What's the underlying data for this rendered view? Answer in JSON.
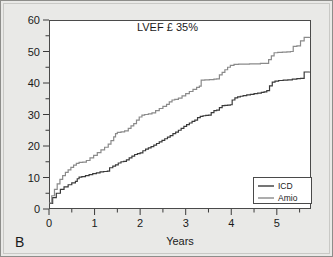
{
  "figure": {
    "panel_label": "B",
    "background_color": "#e9e9e7",
    "plot_background_color": "#ffffff",
    "border_color": "#8d8d8a"
  },
  "chart_data": {
    "type": "line",
    "subtype": "kaplan-meier-cumulative-event",
    "title": "LVEF £ 35%",
    "xlabel": "Years",
    "ylabel": "",
    "xlim": [
      0,
      5.75
    ],
    "ylim": [
      0,
      60
    ],
    "grid": false,
    "legend_position": "lower-right-inside",
    "x_ticks": [
      0,
      1,
      2,
      3,
      4,
      5
    ],
    "x_tick_labels": [
      "0",
      "1",
      "2",
      "3",
      "4",
      "5"
    ],
    "x_minor_ticks": [
      0.5,
      1.5,
      2.5,
      3.5,
      4.5,
      5.5
    ],
    "y_ticks": [
      0,
      10,
      20,
      30,
      40,
      50,
      60
    ],
    "y_tick_labels": [
      "0",
      "10",
      "20",
      "30",
      "40",
      "50",
      "60"
    ],
    "y_minor_ticks": [
      5,
      15,
      25,
      35,
      45,
      55
    ],
    "series": [
      {
        "name": "ICD",
        "color": "#3a3a3a",
        "linewidth": 1.2,
        "points": [
          [
            0.0,
            1.8
          ],
          [
            0.08,
            3.6
          ],
          [
            0.16,
            5.0
          ],
          [
            0.25,
            6.2
          ],
          [
            0.33,
            7.0
          ],
          [
            0.42,
            7.7
          ],
          [
            0.5,
            8.3
          ],
          [
            0.58,
            8.8
          ],
          [
            0.62,
            9.6
          ],
          [
            0.66,
            10.1
          ],
          [
            0.72,
            10.3
          ],
          [
            0.8,
            10.6
          ],
          [
            0.88,
            10.9
          ],
          [
            0.96,
            11.2
          ],
          [
            1.04,
            11.5
          ],
          [
            1.12,
            11.8
          ],
          [
            1.2,
            11.9
          ],
          [
            1.28,
            12.0
          ],
          [
            1.33,
            13.1
          ],
          [
            1.4,
            13.6
          ],
          [
            1.46,
            14.0
          ],
          [
            1.52,
            14.6
          ],
          [
            1.58,
            15.0
          ],
          [
            1.64,
            15.1
          ],
          [
            1.7,
            15.6
          ],
          [
            1.76,
            16.2
          ],
          [
            1.82,
            16.8
          ],
          [
            1.88,
            17.3
          ],
          [
            1.94,
            17.6
          ],
          [
            2.0,
            17.8
          ],
          [
            2.06,
            18.5
          ],
          [
            2.12,
            19.0
          ],
          [
            2.18,
            19.4
          ],
          [
            2.24,
            19.8
          ],
          [
            2.3,
            20.3
          ],
          [
            2.36,
            20.8
          ],
          [
            2.42,
            21.3
          ],
          [
            2.48,
            21.8
          ],
          [
            2.54,
            22.3
          ],
          [
            2.6,
            22.8
          ],
          [
            2.66,
            23.3
          ],
          [
            2.72,
            23.9
          ],
          [
            2.78,
            24.4
          ],
          [
            2.84,
            25.0
          ],
          [
            2.9,
            25.6
          ],
          [
            2.96,
            26.2
          ],
          [
            3.02,
            26.8
          ],
          [
            3.08,
            27.3
          ],
          [
            3.14,
            27.8
          ],
          [
            3.2,
            28.2
          ],
          [
            3.26,
            29.0
          ],
          [
            3.32,
            29.4
          ],
          [
            3.38,
            29.6
          ],
          [
            3.44,
            29.7
          ],
          [
            3.5,
            29.8
          ],
          [
            3.56,
            30.6
          ],
          [
            3.62,
            31.2
          ],
          [
            3.68,
            31.4
          ],
          [
            3.74,
            32.2
          ],
          [
            3.8,
            32.8
          ],
          [
            3.86,
            32.9
          ],
          [
            3.92,
            33.0
          ],
          [
            3.98,
            33.1
          ],
          [
            4.02,
            34.6
          ],
          [
            4.08,
            35.3
          ],
          [
            4.14,
            35.6
          ],
          [
            4.2,
            35.8
          ],
          [
            4.26,
            36.0
          ],
          [
            4.34,
            36.2
          ],
          [
            4.42,
            36.4
          ],
          [
            4.5,
            36.6
          ],
          [
            4.58,
            36.8
          ],
          [
            4.66,
            37.0
          ],
          [
            4.72,
            37.2
          ],
          [
            4.78,
            37.6
          ],
          [
            4.84,
            39.1
          ],
          [
            4.9,
            40.3
          ],
          [
            4.96,
            40.6
          ],
          [
            5.04,
            40.8
          ],
          [
            5.14,
            40.9
          ],
          [
            5.24,
            41.0
          ],
          [
            5.34,
            41.2
          ],
          [
            5.44,
            41.4
          ],
          [
            5.52,
            41.5
          ],
          [
            5.6,
            43.5
          ],
          [
            5.72,
            43.6
          ]
        ]
      },
      {
        "name": "Amio",
        "color": "#8a8a8a",
        "linewidth": 1.2,
        "points": [
          [
            0.0,
            1.9
          ],
          [
            0.06,
            4.2
          ],
          [
            0.12,
            6.2
          ],
          [
            0.18,
            8.0
          ],
          [
            0.24,
            9.4
          ],
          [
            0.3,
            10.6
          ],
          [
            0.36,
            11.6
          ],
          [
            0.42,
            12.4
          ],
          [
            0.48,
            13.2
          ],
          [
            0.54,
            13.9
          ],
          [
            0.6,
            14.5
          ],
          [
            0.66,
            14.8
          ],
          [
            0.74,
            14.9
          ],
          [
            0.82,
            15.4
          ],
          [
            0.9,
            16.2
          ],
          [
            0.98,
            17.0
          ],
          [
            1.06,
            17.9
          ],
          [
            1.14,
            18.8
          ],
          [
            1.22,
            19.6
          ],
          [
            1.3,
            20.6
          ],
          [
            1.36,
            21.7
          ],
          [
            1.42,
            22.9
          ],
          [
            1.46,
            23.9
          ],
          [
            1.5,
            24.3
          ],
          [
            1.58,
            24.5
          ],
          [
            1.66,
            24.8
          ],
          [
            1.74,
            25.6
          ],
          [
            1.8,
            26.4
          ],
          [
            1.86,
            27.1
          ],
          [
            1.92,
            28.2
          ],
          [
            1.98,
            29.2
          ],
          [
            2.04,
            29.8
          ],
          [
            2.1,
            30.0
          ],
          [
            2.18,
            30.2
          ],
          [
            2.26,
            30.5
          ],
          [
            2.34,
            31.2
          ],
          [
            2.42,
            31.9
          ],
          [
            2.5,
            32.6
          ],
          [
            2.58,
            33.2
          ],
          [
            2.64,
            34.0
          ],
          [
            2.7,
            34.6
          ],
          [
            2.76,
            34.8
          ],
          [
            2.84,
            35.2
          ],
          [
            2.92,
            35.9
          ],
          [
            3.0,
            36.6
          ],
          [
            3.08,
            37.3
          ],
          [
            3.16,
            38.0
          ],
          [
            3.24,
            38.6
          ],
          [
            3.3,
            39.0
          ],
          [
            3.34,
            40.9
          ],
          [
            3.42,
            41.0
          ],
          [
            3.52,
            41.1
          ],
          [
            3.62,
            41.2
          ],
          [
            3.68,
            41.3
          ],
          [
            3.74,
            42.6
          ],
          [
            3.8,
            43.4
          ],
          [
            3.86,
            44.2
          ],
          [
            3.92,
            45.0
          ],
          [
            3.98,
            45.6
          ],
          [
            4.06,
            45.9
          ],
          [
            4.16,
            46.0
          ],
          [
            4.28,
            46.0
          ],
          [
            4.4,
            46.1
          ],
          [
            4.52,
            46.1
          ],
          [
            4.64,
            46.2
          ],
          [
            4.76,
            46.2
          ],
          [
            4.82,
            47.4
          ],
          [
            4.88,
            48.6
          ],
          [
            4.94,
            49.6
          ],
          [
            5.02,
            49.7
          ],
          [
            5.12,
            49.8
          ],
          [
            5.22,
            49.9
          ],
          [
            5.3,
            50.0
          ],
          [
            5.36,
            51.6
          ],
          [
            5.44,
            51.8
          ],
          [
            5.52,
            53.4
          ],
          [
            5.6,
            54.5
          ],
          [
            5.72,
            54.6
          ]
        ]
      }
    ],
    "annotations": [
      {
        "text": "LVEF £ 35%",
        "x": 2.6,
        "y": 56.5
      }
    ]
  },
  "legend": {
    "items": [
      {
        "label": "ICD",
        "color": "#3a3a3a"
      },
      {
        "label": "Amio",
        "color": "#8a8a8a"
      }
    ]
  }
}
